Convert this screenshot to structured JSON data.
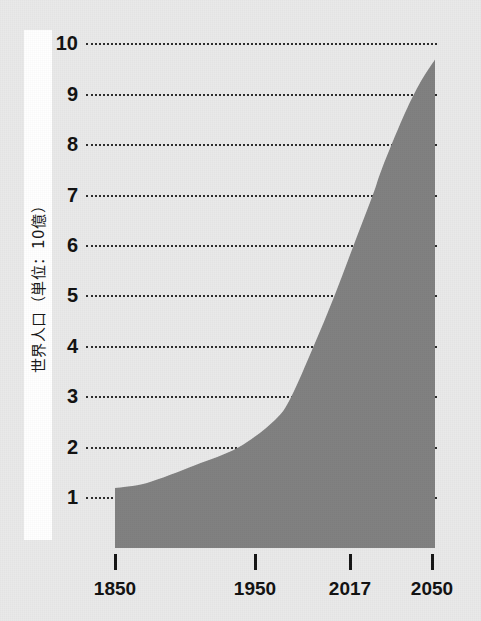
{
  "chart_data": {
    "type": "area",
    "title": "",
    "subtitle": "",
    "xlabel": "",
    "ylabel": "世界人口（単位：10億）",
    "ylabel_unit_note": "単位：10億",
    "x": [
      1850,
      1870,
      1900,
      1927,
      1950,
      1960,
      1974,
      1987,
      1999,
      2011,
      2017,
      2030,
      2040,
      2050
    ],
    "values": [
      1.2,
      1.3,
      1.65,
      2.0,
      2.55,
      3.0,
      4.0,
      5.0,
      6.0,
      7.0,
      7.55,
      8.55,
      9.2,
      9.7
    ],
    "series": [
      {
        "name": "世界人口",
        "values": [
          1.2,
          1.3,
          1.65,
          2.0,
          2.55,
          3.0,
          4.0,
          5.0,
          6.0,
          7.0,
          7.55,
          8.55,
          9.2,
          9.7
        ]
      }
    ],
    "xlim": [
      1850,
      2050
    ],
    "ylim": [
      0,
      10
    ],
    "xticks": [
      1850,
      1950,
      2017,
      2050
    ],
    "xtick_labels": [
      "1850",
      "1950",
      "2017",
      "2050"
    ],
    "yticks": [
      1,
      2,
      3,
      4,
      5,
      6,
      7,
      8,
      9,
      10
    ],
    "ytick_labels": [
      "1",
      "2",
      "3",
      "4",
      "5",
      "6",
      "7",
      "8",
      "9",
      "10"
    ],
    "grid": true,
    "grid_style": "dotted",
    "legend": false,
    "legend_position": "none",
    "area_color": "#7f7f7f",
    "grid_color": "#2b2b2b",
    "background_color": "#e9e9e9",
    "axis_band_color": "#ffffff",
    "text_color": "#101010"
  },
  "geometry": {
    "plot_left": 115,
    "plot_right": 435,
    "baseline_y": 548,
    "y_top": 44,
    "y_bottom": 498,
    "grid_start_x": 86,
    "grid_end_x": 437,
    "y_one_pos": 498,
    "y_step": 50.4,
    "xtick_positions": [
      115,
      255,
      350,
      432
    ]
  }
}
